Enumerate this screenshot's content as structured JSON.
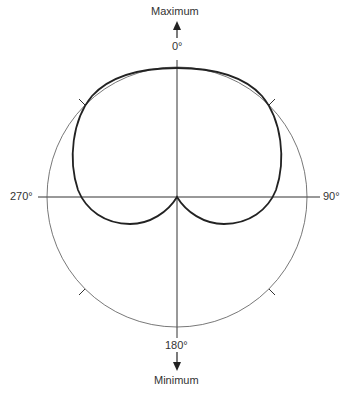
{
  "diagram": {
    "type": "polar-pickup-pattern",
    "top_label": "Maximum",
    "bottom_label": "Minimum",
    "angles": {
      "top": "0°",
      "right": "90°",
      "bottom": "180°",
      "left": "270°"
    },
    "colors": {
      "pattern": "#222222",
      "circle": "#555555",
      "text": "#333333"
    }
  }
}
